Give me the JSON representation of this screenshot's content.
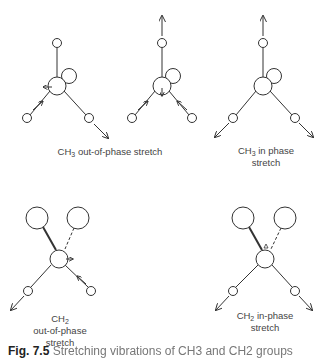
{
  "figure": {
    "caption_label": "Fig. 7.5",
    "caption_text": "Stretching vibrations of CH3 and CH2 groups",
    "panels": [
      {
        "id": "ch3-out-of-phase",
        "group": "CH",
        "subscript": "3",
        "label": "out-of-phase stretch",
        "lines": [
          "CH3 out-of-phase stretch"
        ]
      },
      {
        "id": "ch3-in-phase",
        "group": "CH",
        "subscript": "3",
        "label_line1": "in phase",
        "label_line2": "stretch"
      },
      {
        "id": "ch2-out-of-phase",
        "group": "CH",
        "subscript": "2",
        "label_line1": "out-of-phase",
        "label_line2": "stretch"
      },
      {
        "id": "ch2-in-phase",
        "group": "CH",
        "subscript": "2",
        "label_line1": "in-phase",
        "label_line2": "stretch"
      }
    ],
    "colors": {
      "line": "#333333",
      "background": "#ffffff",
      "text": "#444444"
    }
  }
}
